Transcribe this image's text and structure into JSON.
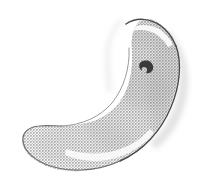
{
  "image": {
    "kind": "scanned-halftone-illustration",
    "subject_name": "crescent-shaped-organ",
    "subject_description": "Crescent / kidney-bean shaped anatomical organ rendered as a coarse halftone dot screen on a plain white page, with a hand-inked contour line.",
    "orientation": "concave side facing upper-left, bulbous body upper-right, tapered rounded tail at lower-left",
    "width_px": 212,
    "height_px": 190,
    "caption": ""
  },
  "palette": {
    "page_background": "#ffffff",
    "halftone_dot": "#a9a9a9",
    "halftone_mid_tone": "#b9b9b9",
    "halftone_light_tone": "#d6d6d6",
    "body_base_fill": "#cfcfcf",
    "contour_ink_dark": "#4a4a4a",
    "contour_ink_mid": "#6e6e6e",
    "contour_ink_light": "#9a9a9a",
    "highlight_white": "#fdfdfd",
    "marking_dark": "#3a3a3a",
    "bleed_halo": "#cdcdcd"
  },
  "geometry": {
    "body_outline_path": "M 172 36 C 182 54 180 82 170 106 C 159 132 140 153 116 163 C 92 173 64 174 44 165 C 30 159 22 149 22 140 C 22 133 27 129 36 127 C 50 125 66 127 82 124 C 100 121 114 112 123 97 C 131 83 133 66 132 50 C 131 38 133 28 139 22 C 147 15 160 20 172 36 Z",
    "top_arc_ink_path": "M 126 24 C 136 17 150 18 161 26 C 168 31 173 39 176 46",
    "right_contour_ink_path": "M 176 46 C 182 62 180 86 171 107 C 161 131 143 151 120 161",
    "bottom_contour_ink_path": "M 120 161 C 96 172 66 173 45 164 C 32 158 24 150 23 141",
    "tail_tip_ink_path": "M 23 141 C 22 132 29 127 39 126 C 47 125 55 126 62 126",
    "inner_concave_ink_path": "M 62 126 C 82 125 100 117 112 103 C 124 88 130 68 129 48",
    "top_highlight_path": "M 130 29 C 140 23 152 24 162 31 C 167 35 171 40 173 45 L 168 47 C 164 40 157 33 148 31 C 140 29 134 30 130 33 Z",
    "lower_highlight_path": "M 66 149 C 84 155 104 155 120 149 C 132 145 142 138 150 129 L 154 133 C 145 144 133 152 119 157 C 102 163 81 162 65 155 Z",
    "inner_edge_highlight_path": "M 118 99 C 127 85 131 68 130 50 L 126 50 C 127 68 123 84 114 97 Z",
    "dark_marking": {
      "cx": 146,
      "cy": 66,
      "rx": 7,
      "ry": 6,
      "rotation_deg": -25,
      "path": "M 141 62 C 146 59 152 61 153 66 C 154 71 150 74 146 73 C 148 70 147 67 144 67 C 142 67 141 69 142 71 C 139 69 138 64 141 62 Z"
    },
    "bleed_halo_path": "M 168 30 C 186 48 192 74 186 100 C 181 122 170 138 156 149 L 150 143 C 164 131 174 114 178 94 C 183 71 179 48 164 33 Z",
    "upper_left_halo_path": "M 124 22 C 114 30 110 42 110 56 C 110 70 112 82 112 92 L 107 92 C 106 80 104 66 105 53 C 106 38 112 26 121 18 Z"
  },
  "halftone": {
    "dot_pitch_px": 3,
    "dot_radius_px": 0.85,
    "pattern_description": "regular square grid of small gray dots forming a checkerboard-like screen",
    "coverage_note": "denser toward the right/convex body, lighter near the inner concave edge and tail"
  },
  "shading_zones": [
    {
      "name": "upper-body-mid-tone",
      "cx": 148,
      "cy": 62,
      "rx": 40,
      "ry": 46,
      "opacity": 0.4
    },
    {
      "name": "central-body-tone",
      "cx": 128,
      "cy": 108,
      "rx": 46,
      "ry": 48,
      "opacity": 0.34
    },
    {
      "name": "lower-body-tone",
      "cx": 86,
      "cy": 144,
      "rx": 50,
      "ry": 24,
      "opacity": 0.3
    },
    {
      "name": "tail-light-tone",
      "cx": 44,
      "cy": 145,
      "rx": 26,
      "ry": 16,
      "opacity": 0.2
    },
    {
      "name": "right-edge-shadow",
      "cx": 166,
      "cy": 88,
      "rx": 18,
      "ry": 52,
      "opacity": 0.3
    },
    {
      "name": "top-shadow",
      "cx": 152,
      "cy": 34,
      "rx": 30,
      "ry": 12,
      "opacity": 0.26
    }
  ],
  "annotations": {
    "dark_marking_label": "dark-ink-marking",
    "tail_label": "tapered-tail-tip",
    "concave_edge_label": "inner-concave-edge",
    "convex_edge_label": "outer-convex-edge"
  }
}
